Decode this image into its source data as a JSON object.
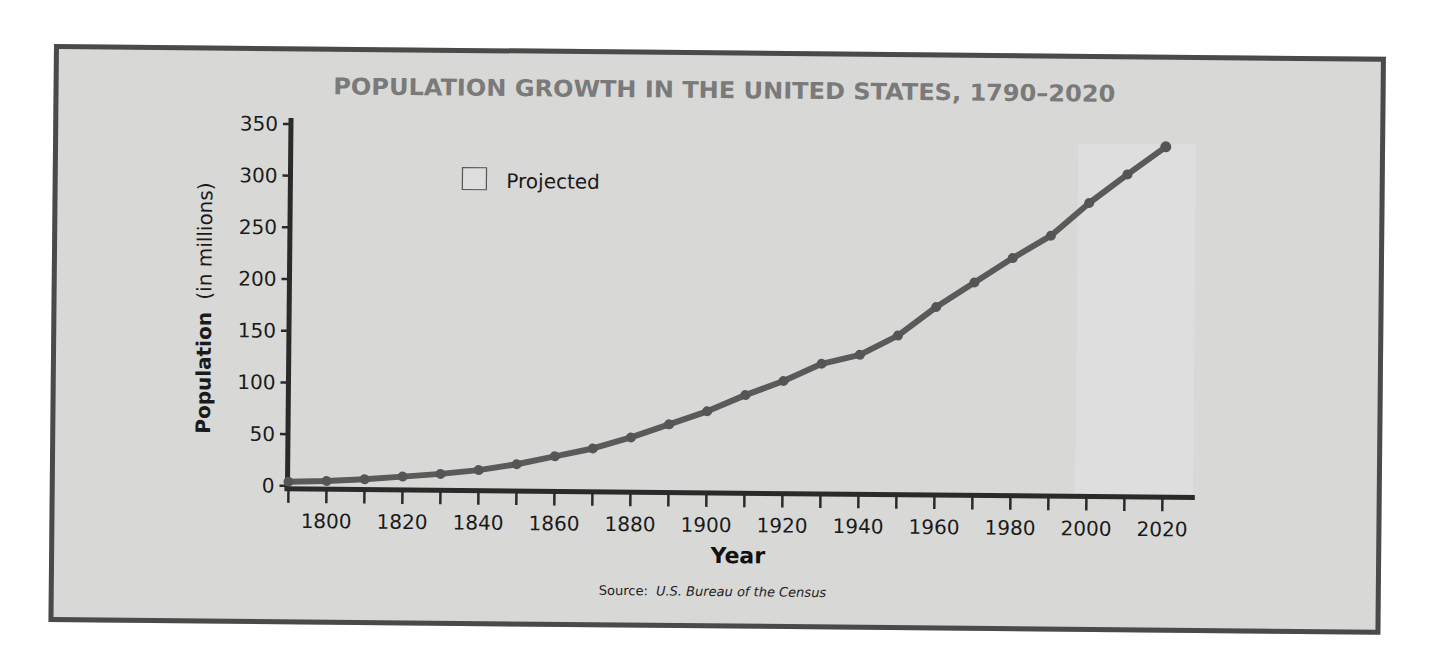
{
  "chart_data": {
    "type": "line",
    "title": "POPULATION GROWTH IN THE UNITED STATES, 1790–2020",
    "xlabel": "Year",
    "ylabel": "Population",
    "ylabel_suffix": "(in millions)",
    "source_prefix": "Source:",
    "source": "U.S. Bureau of the Census",
    "legend": [
      {
        "label": "Projected",
        "swatch": "#dadada"
      }
    ],
    "legend_position": "top-left",
    "grid": false,
    "xlim": [
      1787,
      2028
    ],
    "ylim": [
      0,
      350
    ],
    "x_ticks": [
      1800,
      1820,
      1840,
      1860,
      1880,
      1900,
      1920,
      1940,
      1960,
      1980,
      2000,
      2020
    ],
    "y_ticks": [
      0,
      50,
      100,
      150,
      200,
      250,
      300,
      350
    ],
    "projected_range": [
      1997,
      2028
    ],
    "series": [
      {
        "name": "U.S. Population",
        "x": [
          1790,
          1800,
          1810,
          1820,
          1830,
          1840,
          1850,
          1860,
          1870,
          1880,
          1890,
          1900,
          1910,
          1920,
          1930,
          1940,
          1950,
          1960,
          1970,
          1980,
          1990,
          2000,
          2010,
          2020
        ],
        "values": [
          4,
          5,
          7,
          10,
          13,
          17,
          23,
          31,
          39,
          50,
          63,
          76,
          92,
          106,
          123,
          132,
          151,
          179,
          203,
          227,
          249,
          281,
          309,
          336
        ]
      }
    ],
    "colors": {
      "line": "#5a5a5a",
      "axis": "#2a2a2a",
      "title": "#7a7a7a",
      "frame": "#4a4a4a",
      "background": "#d8d8d6",
      "projected_band": "#dedede"
    }
  }
}
